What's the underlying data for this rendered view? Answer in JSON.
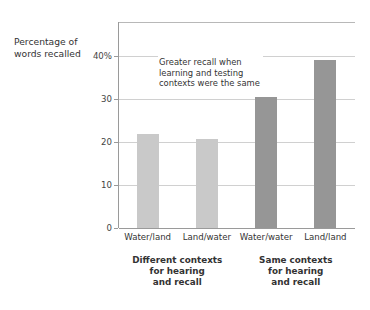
{
  "chart_data": {
    "type": "bar",
    "title": "",
    "xlabel": "",
    "ylabel": "Percentage of\nwords recalled",
    "categories": [
      "Water/land",
      "Land/water",
      "Water/water",
      "Land/land"
    ],
    "values": [
      21.8,
      20.8,
      30.5,
      39.2
    ],
    "series": [
      {
        "name": "Percentage of words recalled",
        "values": [
          21.8,
          20.8,
          30.5,
          39.2
        ]
      }
    ],
    "bar_colors": [
      "#c9c9c9",
      "#c9c9c9",
      "#969696",
      "#969696"
    ],
    "ylim": [
      0,
      48
    ],
    "yticks": [
      0,
      10,
      20,
      30,
      40
    ],
    "ytick_labels": [
      "0",
      "10",
      "20",
      "30",
      "40%"
    ],
    "grid": true,
    "legend": null,
    "annotations": [
      {
        "text": "Greater recall when\nlearning and testing\ncontexts were the same",
        "x": 1.0,
        "y": 40
      }
    ],
    "group_labels": [
      {
        "text": "Different contexts\nfor hearing\nand recall",
        "categories": [
          "Water/land",
          "Land/water"
        ]
      },
      {
        "text": "Same contexts\nfor hearing\nand recall",
        "categories": [
          "Water/water",
          "Land/land"
        ]
      }
    ]
  },
  "colors": {
    "light_bar": "#c9c9c9",
    "dark_bar": "#969696",
    "gridline": "#d0d0d0",
    "axis": "#9a9a9a",
    "text": "#333333",
    "background": "#ffffff"
  }
}
